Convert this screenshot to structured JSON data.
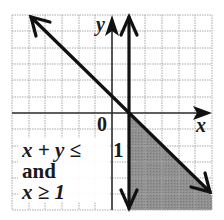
{
  "graph": {
    "x_axis_label": "x",
    "y_axis_label": "y",
    "origin_label": "0",
    "tick_label_one": "1",
    "grid": {
      "x_min": -6,
      "x_max": 6,
      "y_min": -6,
      "y_max": 6,
      "step": 1
    },
    "lines": [
      {
        "name": "x + y = 1",
        "style": "solid",
        "arrows": "both"
      },
      {
        "name": "x = 1",
        "style": "solid",
        "arrows": "both"
      }
    ],
    "shaded_region": "x + y ≤ 1 and x ≥ 1",
    "colors": {
      "grid": "#9a9a9a",
      "axis": "#2a2a2a",
      "line": "#111111",
      "shade": "#8c8c8c",
      "background": "#ffffff"
    }
  },
  "caption": {
    "line1_lhs": "x + y ≤",
    "line1_rhs": "1",
    "line2": "and",
    "line3": "x ≥ 1"
  }
}
